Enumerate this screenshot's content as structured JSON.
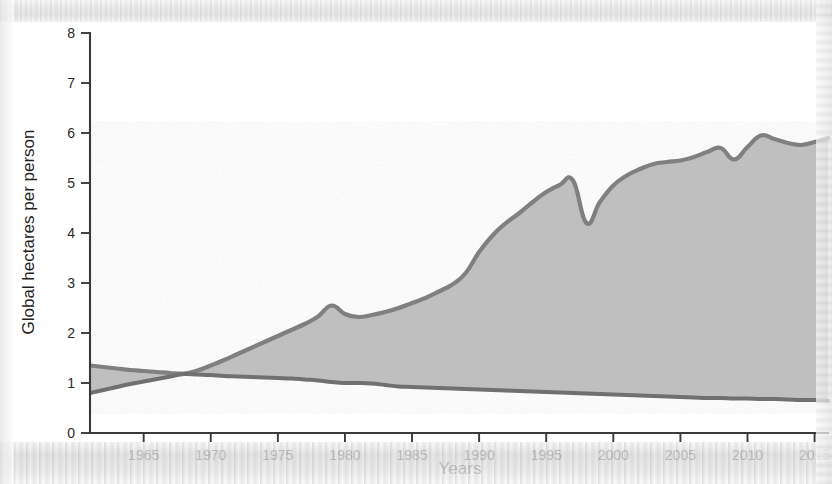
{
  "figure": {
    "background_color": "#ffffff",
    "fill_color": "#bfbfbf",
    "line_color": "#808080",
    "axis_color": "#3a3a3a"
  },
  "axes": {
    "y_title": "Global hectares per person",
    "x_title": "Years",
    "y_ticks": [
      "0",
      "1",
      "2",
      "3",
      "4",
      "5",
      "6",
      "7",
      "8"
    ],
    "x_ticks": [
      "1965",
      "1970",
      "1975",
      "1980",
      "1985",
      "1990",
      "1995",
      "2000",
      "2005",
      "2010",
      "2015"
    ]
  },
  "chart_data": {
    "type": "area",
    "title": "",
    "subtitle": "",
    "xlabel": "Years",
    "ylabel": "Global hectares per person",
    "xlim": [
      1961,
      2016
    ],
    "ylim": [
      0,
      8
    ],
    "grid": false,
    "legend": "none",
    "annotations": [
      "Upper curve rises steeply after 1988, peaks near 5.05 in 1997, dips to 4.2 in 1998, then climbs to about 5.9 by 2016",
      "Lower curve declines slowly from about 1.2 in 1968 to about 0.65 in 2016",
      "Curves cross near 1968 at about 1.18",
      "Shaded area between the two curves is filled light gray"
    ],
    "x": [
      1961,
      1962,
      1963,
      1964,
      1965,
      1966,
      1967,
      1968,
      1969,
      1970,
      1971,
      1972,
      1973,
      1974,
      1975,
      1976,
      1977,
      1978,
      1979,
      1980,
      1981,
      1982,
      1983,
      1984,
      1985,
      1986,
      1987,
      1988,
      1989,
      1990,
      1991,
      1992,
      1993,
      1994,
      1995,
      1996,
      1997,
      1998,
      1999,
      2000,
      2001,
      2002,
      2003,
      2004,
      2005,
      2006,
      2007,
      2008,
      2009,
      2010,
      2011,
      2012,
      2013,
      2014,
      2015,
      2016
    ],
    "series": [
      {
        "name": "Ecological Footprint",
        "values": [
          1.35,
          1.32,
          1.29,
          1.26,
          1.24,
          1.22,
          1.2,
          1.19,
          1.25,
          1.35,
          1.46,
          1.58,
          1.7,
          1.82,
          1.94,
          2.06,
          2.18,
          2.33,
          2.55,
          2.38,
          2.32,
          2.36,
          2.42,
          2.5,
          2.6,
          2.7,
          2.83,
          2.97,
          3.2,
          3.62,
          3.95,
          4.2,
          4.4,
          4.62,
          4.82,
          4.96,
          5.05,
          4.2,
          4.62,
          4.95,
          5.15,
          5.28,
          5.38,
          5.42,
          5.45,
          5.52,
          5.62,
          5.7,
          5.47,
          5.72,
          5.95,
          5.88,
          5.8,
          5.76,
          5.82,
          5.9
        ]
      },
      {
        "name": "Biocapacity",
        "values": [
          0.8,
          0.86,
          0.92,
          0.98,
          1.03,
          1.08,
          1.13,
          1.18,
          1.17,
          1.16,
          1.14,
          1.13,
          1.12,
          1.11,
          1.1,
          1.09,
          1.07,
          1.05,
          1.02,
          1.0,
          1.0,
          0.99,
          0.96,
          0.93,
          0.92,
          0.91,
          0.9,
          0.89,
          0.88,
          0.87,
          0.86,
          0.85,
          0.84,
          0.83,
          0.82,
          0.81,
          0.8,
          0.79,
          0.78,
          0.77,
          0.76,
          0.75,
          0.74,
          0.73,
          0.72,
          0.71,
          0.7,
          0.7,
          0.69,
          0.69,
          0.68,
          0.68,
          0.67,
          0.66,
          0.66,
          0.65
        ]
      }
    ]
  }
}
